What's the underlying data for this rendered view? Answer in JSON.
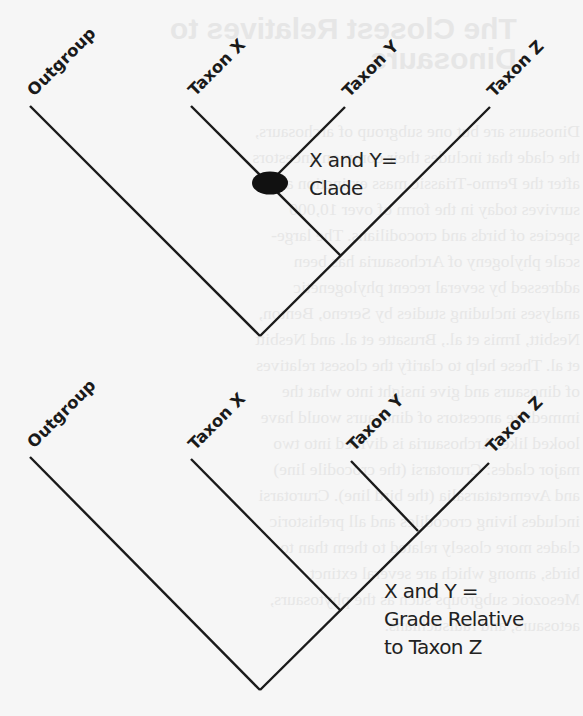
{
  "background_page": {
    "title_lines": [
      "The Closest Relatives to",
      "Dinosaurs"
    ],
    "paragraph": "Dinosaurs are but one subgroup of archosaurs, the clade that includes their common ancestors after the Permo-Triassic mass extinction and survives today in the form of over 10,000 species of birds and crocodilians. The large-scale phylogeny of Archosauria has been addressed by several recent phylogenetic analyses including studies by Sereno, Benton, Nesbitt, Irmis et al., Brusatte et al. and Nesbitt et al. These help to clarify the closest relatives of dinosaurs and give insight into what the immediate ancestors of dinosaurs would have looked like. Archosauria is divided into two major clades: Crurotarsi (the crocodile line) and Avemetatarsalia (the bird line). Crurotarsi includes living crocodiles and all prehistoric clades more closely related to them than to birds, among which are several extinct Mesozoic subgroups such as the phytosaurs, aetosaurs, and rauisuchians."
  },
  "diagrams": [
    {
      "id": "clade",
      "taxa": [
        "Outgroup",
        "Taxon X",
        "Taxon Y",
        "Taxon Z"
      ],
      "annotation": [
        "X and Y=",
        "Clade"
      ],
      "node_marker": "filled-ellipse",
      "colors": {
        "line": "#1a1a1a",
        "marker": "#111111",
        "text": "#222222"
      }
    },
    {
      "id": "grade",
      "taxa": [
        "Outgroup",
        "Taxon X",
        "Taxon Y",
        "Taxon Z"
      ],
      "annotation": [
        "X and Y =",
        "Grade Relative",
        "to Taxon Z"
      ],
      "colors": {
        "line": "#1a1a1a",
        "text": "#222222"
      }
    }
  ]
}
